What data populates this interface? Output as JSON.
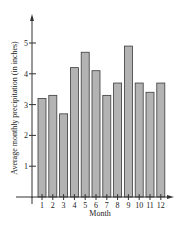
{
  "chart_data": {
    "type": "bar",
    "title": "",
    "xlabel": "Month",
    "ylabel": "Average monthly precipitation (in inches)",
    "categories": [
      "1",
      "2",
      "3",
      "4",
      "5",
      "6",
      "7",
      "8",
      "9",
      "10",
      "11",
      "12"
    ],
    "values": [
      3.2,
      3.3,
      2.7,
      4.2,
      4.7,
      4.1,
      3.3,
      3.7,
      4.9,
      3.7,
      3.4,
      3.7
    ],
    "ylim": [
      0,
      5.8
    ],
    "yticks": [
      "1",
      "2",
      "3",
      "4",
      "5"
    ],
    "grid": false,
    "legend": null,
    "colors": {
      "bar_fill": "#b3b3b3",
      "bar_stroke": "#3a3a3a",
      "axis": "#333333"
    }
  }
}
